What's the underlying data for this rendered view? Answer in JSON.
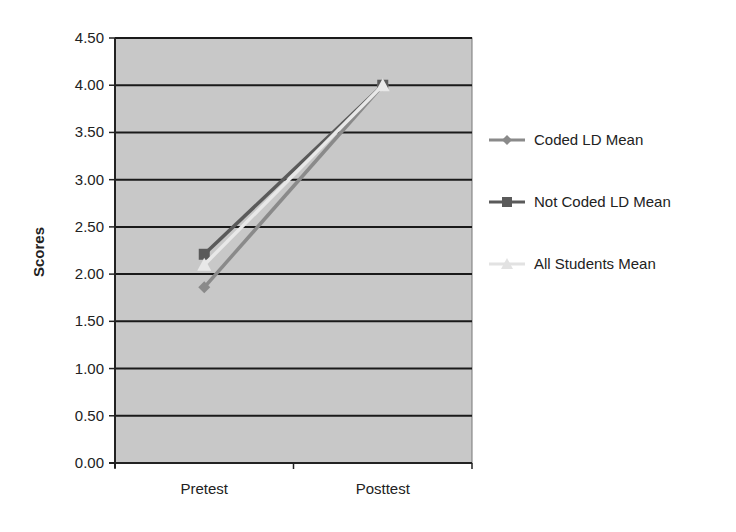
{
  "chart_data": {
    "type": "line",
    "title": "",
    "xlabel": "",
    "ylabel": "Scores",
    "categories": [
      "Pretest",
      "Posttest"
    ],
    "ylim": [
      0,
      4.5
    ],
    "yticks": [
      "0.00",
      "0.50",
      "1.00",
      "1.50",
      "2.00",
      "2.50",
      "3.00",
      "3.50",
      "4.00",
      "4.50"
    ],
    "grid": true,
    "legend_position": "right",
    "series": [
      {
        "name": "Coded LD Mean",
        "marker": "diamond",
        "color": "#8a8a8a",
        "values": [
          1.86,
          4.0
        ]
      },
      {
        "name": "Not Coded LD Mean",
        "marker": "square",
        "color": "#5a5a5a",
        "values": [
          2.21,
          4.0
        ]
      },
      {
        "name": "All Students Mean",
        "marker": "triangle",
        "color": "#e8e8e8",
        "values": [
          2.1,
          4.0
        ]
      }
    ]
  },
  "legend": {
    "items": [
      {
        "label": "Coded LD Mean"
      },
      {
        "label": "Not Coded LD Mean"
      },
      {
        "label": "All Students Mean"
      }
    ]
  },
  "colors": {
    "plot_background": "#c8c8c8",
    "gridline": "#1a1a1a"
  }
}
